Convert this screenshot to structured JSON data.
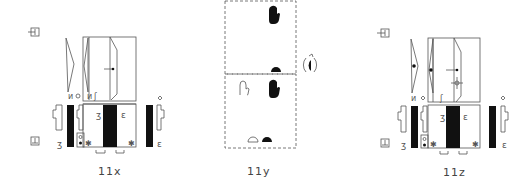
{
  "figures": [
    {
      "id": "11x",
      "label": "11x",
      "type": "notation-diagram"
    },
    {
      "id": "11y",
      "label": "11y",
      "type": "hand-shape-diagram"
    },
    {
      "id": "11z",
      "label": "11z",
      "type": "notation-diagram"
    }
  ],
  "colors": {
    "line": "#555555",
    "fill": "#111111",
    "background": "#ffffff",
    "label": "#444444"
  }
}
